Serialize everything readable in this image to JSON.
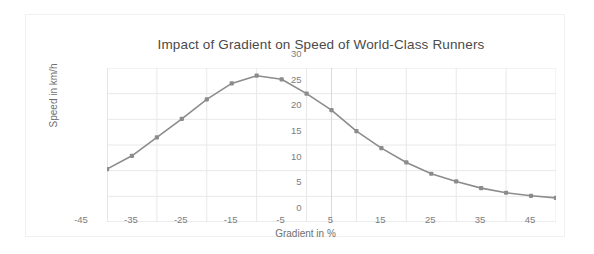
{
  "chart_data": {
    "type": "line",
    "title": "Impact of Gradient on Speed of World-Class Runners",
    "xlabel": "Gradient in %",
    "ylabel": "Speed in km/h",
    "xlim": [
      -45,
      45
    ],
    "ylim": [
      0,
      30
    ],
    "xticks": [
      -45,
      -35,
      -25,
      -15,
      -5,
      5,
      15,
      25,
      35,
      45
    ],
    "xtick_labels": [
      "-45",
      "-35",
      "-25",
      "-15",
      "-5",
      "5",
      "15",
      "25",
      "35",
      "45"
    ],
    "yticks": [
      0,
      5,
      10,
      15,
      20,
      25,
      30
    ],
    "ytick_labels": [
      "0",
      "5",
      "10",
      "15",
      "20",
      "25",
      "30"
    ],
    "grid": true,
    "legend": "none",
    "series_color": "#8c8c8c",
    "marker": "square",
    "x": [
      -45,
      -40,
      -35,
      -30,
      -25,
      -20,
      -15,
      -10,
      -5,
      0,
      5,
      10,
      15,
      20,
      25,
      30,
      35,
      40,
      45
    ],
    "values": [
      10.3,
      12.9,
      16.5,
      20.1,
      23.9,
      27.0,
      28.5,
      27.8,
      25.0,
      21.8,
      17.7,
      14.4,
      11.6,
      9.4,
      7.9,
      6.6,
      5.7,
      5.1,
      4.7
    ],
    "series": [
      {
        "name": "Speed",
        "values": [
          10.3,
          12.9,
          16.5,
          20.1,
          23.9,
          27.0,
          28.5,
          27.8,
          25.0,
          21.8,
          17.7,
          14.4,
          11.6,
          9.4,
          7.9,
          6.6,
          5.7,
          5.1,
          4.7
        ]
      }
    ]
  },
  "colors": {
    "line": "#8c8c8c",
    "marker": "#8c8c8c",
    "grid": "#e8e8e8",
    "axis": "#d9d9d9",
    "title_text": "#4a4a4a",
    "tick_text": "#7d7d7d",
    "frame": "#f0f0f0"
  }
}
